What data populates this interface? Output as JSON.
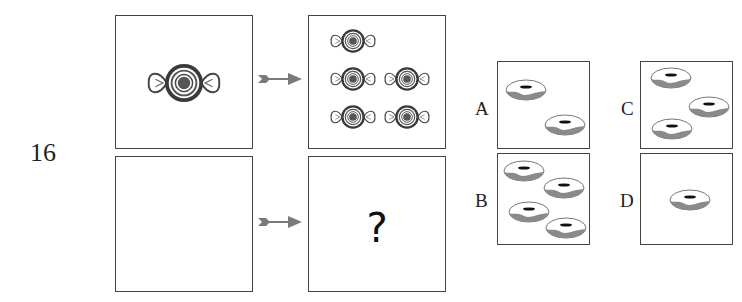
{
  "question": {
    "number": "16",
    "prompt_cells": [
      {
        "id": "top-left",
        "content": "candy",
        "count": 1
      },
      {
        "id": "top-right",
        "content": "candy",
        "count": 5
      },
      {
        "id": "bottom-left",
        "content": "empty",
        "count": 0
      },
      {
        "id": "bottom-right",
        "content": "question-mark",
        "text": "?"
      }
    ],
    "arrows": [
      "arrow-icon",
      "arrow-icon"
    ]
  },
  "options": [
    {
      "label": "A",
      "item": "donut",
      "count": 2
    },
    {
      "label": "B",
      "item": "donut",
      "count": 4
    },
    {
      "label": "C",
      "item": "donut",
      "count": 3
    },
    {
      "label": "D",
      "item": "donut",
      "count": 1
    }
  ],
  "colors": {
    "border": "#444444",
    "arrow": "#7a7a7a",
    "candy_dark": "#3a3a3a",
    "donut_shade": "#8a8a8a"
  }
}
